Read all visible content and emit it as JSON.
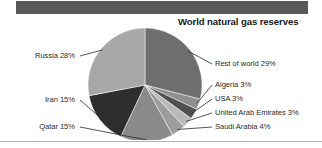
{
  "header": {
    "bar_color": "#585858"
  },
  "chart_data": {
    "type": "pie",
    "title": "World natural gas reserves",
    "xlabel": "",
    "ylabel": "",
    "grid": false,
    "legend_position": "callout-labels",
    "units": "percent",
    "start_angle_deg": 0,
    "direction": "clockwise",
    "categories": [
      "Rest of world",
      "Algeria",
      "USA",
      "United Arab Emirates",
      "Saudi Arabia",
      "Qatar",
      "Iran",
      "Russia"
    ],
    "values": [
      29,
      3,
      3,
      3,
      4,
      15,
      15,
      28
    ],
    "labels": [
      "Rest of world 29%",
      "Algeria 3%",
      "USA 3%",
      "United Arab Emirates 3%",
      "Saudi Arabia 4%",
      "Qatar 15%",
      "Iran 15%",
      "Russia 28%"
    ],
    "colors": [
      "#6e6e6e",
      "#8f8f8f",
      "#4f4f4f",
      "#b9b9b9",
      "#9d9d9d",
      "#8a8a8a",
      "#2e2e2e",
      "#a8a8a8"
    ],
    "slices": [
      {
        "name": "Rest of world",
        "value": 29,
        "label": "Rest of world 29%",
        "color": "#6e6e6e",
        "side": "right"
      },
      {
        "name": "Algeria",
        "value": 3,
        "label": "Algeria 3%",
        "color": "#8f8f8f",
        "side": "right"
      },
      {
        "name": "USA",
        "value": 3,
        "label": "USA 3%",
        "color": "#4f4f4f",
        "side": "right"
      },
      {
        "name": "United Arab Emirates",
        "value": 3,
        "label": "United Arab Emirates 3%",
        "color": "#b9b9b9",
        "side": "right"
      },
      {
        "name": "Saudi Arabia",
        "value": 4,
        "label": "Saudi Arabia 4%",
        "color": "#9d9d9d",
        "side": "right"
      },
      {
        "name": "Qatar",
        "value": 15,
        "label": "Qatar 15%",
        "color": "#8a8a8a",
        "side": "left"
      },
      {
        "name": "Iran",
        "value": 15,
        "label": "Iran 15%",
        "color": "#2e2e2e",
        "side": "left"
      },
      {
        "name": "Russia",
        "value": 28,
        "label": "Russia 28%",
        "color": "#a8a8a8",
        "side": "left"
      }
    ]
  },
  "figure": {
    "rule_color": "#b4b4b4"
  }
}
